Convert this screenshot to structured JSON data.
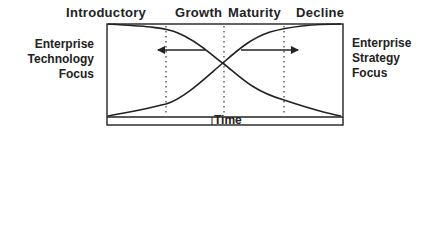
{
  "diagram": {
    "type": "lifecycle-crossover",
    "phases": [
      {
        "label": "Introductory",
        "x": 66
      },
      {
        "label": "Growth",
        "x": 145
      },
      {
        "label": "Maturity",
        "x": 228
      },
      {
        "label": "Decline",
        "x": 296
      }
    ],
    "left_label": {
      "line1": "Enterprise",
      "line2": "Technology",
      "line3": "Focus"
    },
    "right_label": {
      "line1": "Enterprise",
      "line2": "Strategy",
      "line3": "Focus"
    },
    "x_axis_label": "Time",
    "curves": [
      {
        "name": "technology-focus",
        "direction": "decreasing"
      },
      {
        "name": "strategy-focus",
        "direction": "increasing"
      }
    ],
    "arrows": [
      {
        "name": "arrow-left",
        "direction": "left"
      },
      {
        "name": "arrow-right",
        "direction": "right"
      }
    ],
    "colors": {
      "line": "#222222",
      "background": "#ffffff"
    }
  }
}
